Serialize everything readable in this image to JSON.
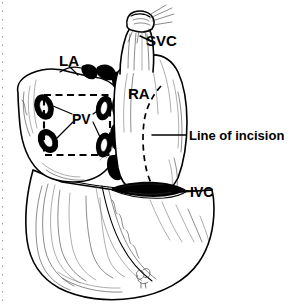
{
  "figure": {
    "background_color": "#ffffff",
    "ink_color": "#000000",
    "width": 298,
    "height": 307
  },
  "labels": {
    "svc": "SVC",
    "la": "LA",
    "ra": "RA",
    "pv": "PV",
    "ivc": "IVC",
    "line_of_incision": "Line of incision"
  },
  "structures": {
    "svc_stump": "superior-vena-cava-stump",
    "ivc_stump": "inferior-vena-cava-stump",
    "right_atrium": "right-atrium-body",
    "left_atrium": "left-atrium-body",
    "ventricular_mass": "ventricular-mass",
    "pulmonary_vein_ostia_count": 4,
    "pv_cuff_box": "dashed-pulmonary-vein-cuff-outline",
    "incision_path": "dashed-curved-incision-line-right-atrium"
  },
  "annotations": {
    "artist_signature": "monogram"
  }
}
